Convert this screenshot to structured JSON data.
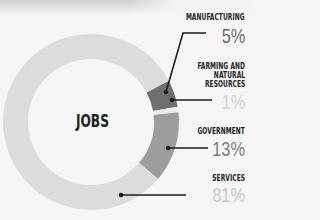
{
  "chart_data": {
    "type": "pie",
    "variant": "donut",
    "title": "JOBS",
    "slices": [
      {
        "label": "MANUFACTURING",
        "value": 5,
        "display": "5%",
        "color": "#6f6f6f",
        "pct_color": "#6a6a6a"
      },
      {
        "label": "FARMING AND NATURAL RESOURCES",
        "value": 1,
        "display": "1%",
        "color": "#ececec",
        "pct_color": "#d2d2d2"
      },
      {
        "label": "GOVERNMENT",
        "value": 13,
        "display": "13%",
        "color": "#9d9d9d",
        "pct_color": "#7d7d7d"
      },
      {
        "label": "SERVICES",
        "value": 81,
        "display": "81%",
        "color": "#dcdcdc",
        "pct_color": "#c8c8c8"
      }
    ],
    "legend": "right"
  },
  "labels": {
    "manufacturing": {
      "line1": "MANUFACTURING",
      "pct": "5%"
    },
    "farming": {
      "line1": "FARMING AND",
      "line2": "NATURAL",
      "line3": "RESOURCES",
      "pct": "1%"
    },
    "government": {
      "line1": "GOVERNMENT",
      "pct": "13%"
    },
    "services": {
      "line1": "SERVICES",
      "pct": "81%"
    }
  }
}
